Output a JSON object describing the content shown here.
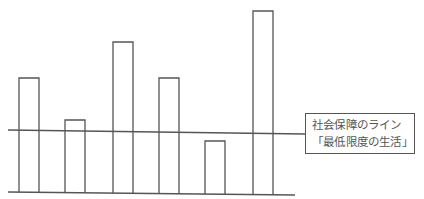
{
  "diagram": {
    "type": "bar-comparison",
    "bars": [
      {
        "id": 1,
        "x": 19,
        "top": 78
      },
      {
        "id": 2,
        "x": 65,
        "top": 120
      },
      {
        "id": 3,
        "x": 113,
        "top": 42
      },
      {
        "id": 4,
        "x": 159,
        "top": 78
      },
      {
        "id": 5,
        "x": 205,
        "top": 141
      },
      {
        "id": 6,
        "x": 253,
        "top": 11
      }
    ],
    "bar_width": 20,
    "baseline": {
      "x1": 8,
      "y1": 192,
      "x2": 295,
      "y2": 195
    },
    "threshold_line": {
      "x1": 8,
      "y1": 130,
      "x2": 305,
      "y2": 134
    },
    "colors": {
      "stroke": "#555555",
      "background": "#ffffff",
      "text": "#555555"
    }
  },
  "label": {
    "line1": "社会保障のライン",
    "line2": "「最低限度の生活」"
  }
}
